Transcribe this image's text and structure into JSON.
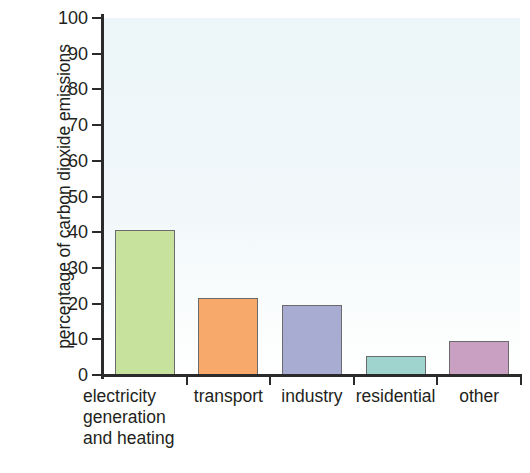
{
  "chart_data": {
    "type": "bar",
    "title": "",
    "xlabel": "",
    "ylabel": "percentage of carbon dioxide emissions",
    "ylim": [
      0,
      100
    ],
    "ytick_step": 10,
    "grid": false,
    "legend": "none",
    "categories": [
      "electricity generation and heating",
      "transport",
      "industry",
      "residential",
      "other"
    ],
    "category_lines": [
      [
        "electricity",
        "generation",
        "and heating"
      ],
      [
        "transport"
      ],
      [
        "industry"
      ],
      [
        "residential"
      ],
      [
        "other"
      ]
    ],
    "values": [
      40.5,
      21.5,
      19.5,
      5.3,
      9.5
    ],
    "ytick_labels": [
      "100",
      "90",
      "80",
      "70",
      "60",
      "50",
      "40",
      "30",
      "20",
      "10",
      "0"
    ],
    "bar_colors": [
      "#c7e29c",
      "#f6a96a",
      "#a8acd2",
      "#9fd3cd",
      "#c9a0c2"
    ],
    "bar_edge_color": "#6b6b6b",
    "axis_color": "#2b2b2b",
    "plot_background": "#eef7f9",
    "figure_background": "#ffffff"
  }
}
